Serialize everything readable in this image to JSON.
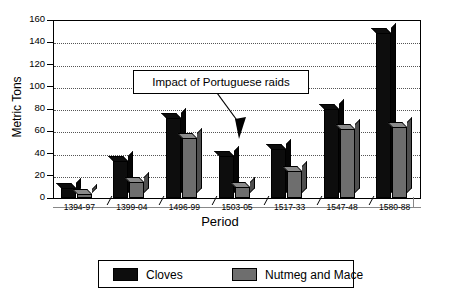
{
  "chart_data": {
    "type": "bar",
    "title": "",
    "xlabel": "Period",
    "ylabel": "Metric Tons",
    "categories": [
      "1394-97",
      "1399-04",
      "1496-99",
      "1503-05",
      "1517-33",
      "1547-48",
      "1580-88"
    ],
    "series": [
      {
        "name": "Cloves",
        "color": "#0d0d0d",
        "values": [
          9,
          33,
          72,
          38,
          44,
          80,
          148
        ]
      },
      {
        "name": "Nutmeg and Mace",
        "color": "#6e6e6e",
        "values": [
          4,
          14,
          54,
          10,
          24,
          62,
          64
        ]
      }
    ],
    "ylim": [
      0,
      160
    ],
    "yticks": [
      0,
      20,
      40,
      60,
      80,
      100,
      120,
      140,
      160
    ],
    "grid": true,
    "legend_position": "bottom",
    "annotations": [
      {
        "text": "Impact of Portuguese raids",
        "points_to": "1503-05"
      }
    ]
  },
  "legend": {
    "items": [
      {
        "label": "Cloves",
        "color": "#0d0d0d"
      },
      {
        "label": "Nutmeg and Mace",
        "color": "#6e6e6e"
      }
    ]
  }
}
